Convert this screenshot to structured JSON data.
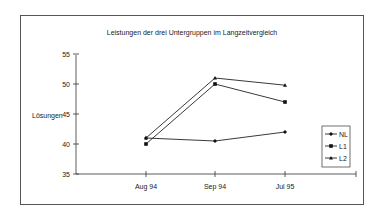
{
  "chart_data": {
    "type": "line",
    "title": "Leistungen der drei Untergruppen im Langzeitvergleich",
    "xlabel": "",
    "ylabel": "Lösungen",
    "categories": [
      "Aug 94",
      "Sep 94",
      "Jul 95"
    ],
    "ylim": [
      35,
      55
    ],
    "yticks": [
      35,
      40,
      45,
      50,
      55
    ],
    "grid": false,
    "legend_position": "right",
    "series": [
      {
        "name": "NL",
        "marker": "diamond",
        "values": [
          41,
          40.5,
          42
        ]
      },
      {
        "name": "L1",
        "marker": "square",
        "values": [
          40,
          50,
          47
        ]
      },
      {
        "name": "L2",
        "marker": "triangle",
        "values": [
          41,
          51,
          49.8
        ]
      }
    ]
  },
  "ui": {
    "title": "Leistungen der drei Untergruppen im Langzeitvergleich",
    "ylabel": "Lösungen",
    "yticks": [
      "55",
      "50",
      "45",
      "40",
      "35"
    ],
    "xticks": [
      "Aug 94",
      "Sep 94",
      "Jul 95"
    ],
    "legend": [
      "NL",
      "L1",
      "L2"
    ]
  }
}
